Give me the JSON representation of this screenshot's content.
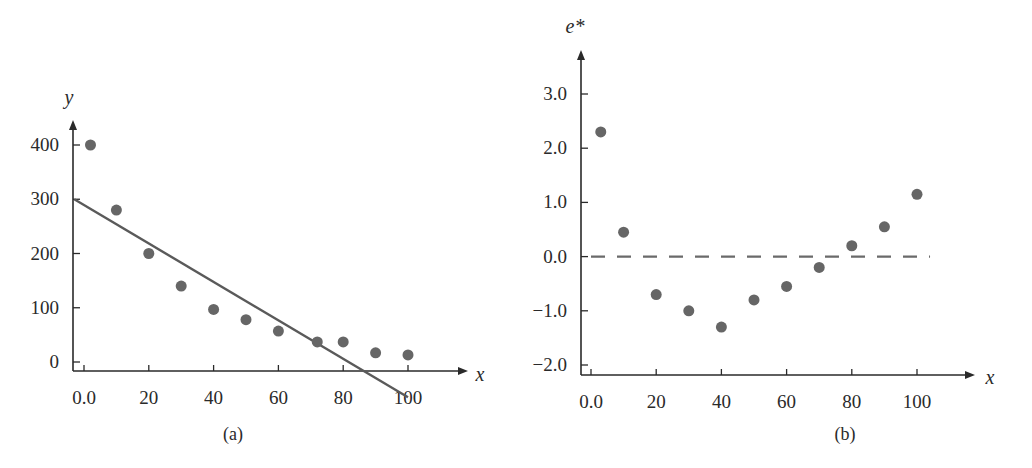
{
  "colors": {
    "axis": "#2a2a2a",
    "point": "#666666",
    "line": "#5a5a5a",
    "dashed": "#6a6a6a",
    "text": "#2a2a2a"
  },
  "chart_data": [
    {
      "type": "scatter",
      "panel_label": "(a)",
      "title": "",
      "xlabel": "x",
      "ylabel": "y",
      "xlim": [
        0,
        100
      ],
      "ylim": [
        0,
        400
      ],
      "x_ticks": [
        0,
        20,
        40,
        60,
        80,
        100
      ],
      "x_tick_labels": [
        "0.0",
        "20",
        "40",
        "60",
        "80",
        "100"
      ],
      "y_ticks": [
        0,
        100,
        200,
        300,
        400
      ],
      "y_tick_labels": [
        "0",
        "100",
        "200",
        "300",
        "400"
      ],
      "grid": false,
      "legend": null,
      "points": [
        {
          "x": 2,
          "y": 400
        },
        {
          "x": 10,
          "y": 280
        },
        {
          "x": 20,
          "y": 200
        },
        {
          "x": 30,
          "y": 140
        },
        {
          "x": 40,
          "y": 97
        },
        {
          "x": 50,
          "y": 78
        },
        {
          "x": 60,
          "y": 57
        },
        {
          "x": 72,
          "y": 37
        },
        {
          "x": 80,
          "y": 37
        },
        {
          "x": 90,
          "y": 17
        },
        {
          "x": 100,
          "y": 13
        }
      ],
      "fitted_line": {
        "x0": -3,
        "y0": 300,
        "x1": 100,
        "y1": -65,
        "style": "solid"
      }
    },
    {
      "type": "scatter",
      "panel_label": "(b)",
      "title": "",
      "xlabel": "x",
      "ylabel": "e*",
      "xlim": [
        0,
        100
      ],
      "ylim": [
        -2.0,
        3.0
      ],
      "x_ticks": [
        0,
        20,
        40,
        60,
        80,
        100
      ],
      "x_tick_labels": [
        "0.0",
        "20",
        "40",
        "60",
        "80",
        "100"
      ],
      "y_ticks": [
        -2.0,
        -1.0,
        0.0,
        1.0,
        2.0,
        3.0
      ],
      "y_tick_labels": [
        "−2.0",
        "−1.0",
        "0.0",
        "1.0",
        "2.0",
        "3.0"
      ],
      "grid": false,
      "legend": null,
      "points": [
        {
          "x": 3,
          "y": 2.3
        },
        {
          "x": 10,
          "y": 0.45
        },
        {
          "x": 20,
          "y": -0.7
        },
        {
          "x": 30,
          "y": -1.0
        },
        {
          "x": 40,
          "y": -1.3
        },
        {
          "x": 50,
          "y": -0.8
        },
        {
          "x": 60,
          "y": -0.55
        },
        {
          "x": 70,
          "y": -0.2
        },
        {
          "x": 80,
          "y": 0.2
        },
        {
          "x": 90,
          "y": 0.55
        },
        {
          "x": 100,
          "y": 1.15
        }
      ],
      "reference_line": {
        "y": 0.0,
        "x0": 0,
        "x1": 104,
        "style": "dashed"
      }
    }
  ],
  "layout": [
    {
      "yaxis_x": 73,
      "xaxis_y": 371,
      "y_top": 120,
      "x_right": 468,
      "px_x0": 84,
      "px_x100": 408,
      "px_y_min": 362,
      "px_y_max": 145,
      "ylabel_pos": [
        69,
        104
      ],
      "xlabel_pos": [
        480,
        381
      ],
      "caption_pos": [
        233,
        440
      ],
      "ticklabel_x_y": 404
    },
    {
      "yaxis_x": 581,
      "xaxis_y": 375,
      "y_top": 50,
      "x_right": 975,
      "px_x0": 591,
      "px_x100": 917,
      "px_y_min": 365,
      "px_y_max": 94,
      "ylabel_pos": [
        575,
        33
      ],
      "xlabel_pos": [
        990,
        384
      ],
      "caption_pos": [
        845,
        440
      ],
      "ticklabel_x_y": 408
    }
  ]
}
